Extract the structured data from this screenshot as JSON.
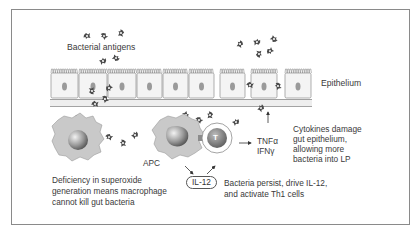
{
  "figure": {
    "labels": {
      "bacterial_antigens": "Bacterial antigens",
      "epithelium": "Epithelium",
      "apc": "APC",
      "t_cell": "T",
      "il12": "IL-12",
      "tnf": "TNFα",
      "ifn": "IFNγ"
    },
    "captions": {
      "cytokines": [
        "Cytokines damage",
        "gut epithelium,",
        "allowing more",
        "bacteria into LP"
      ],
      "macrophage": [
        "Deficiency in superoxide",
        "generation means macrophage",
        "cannot kill gut bacteria"
      ],
      "bacteria_persist": [
        "Bacteria persist, drive IL-12,",
        "and activate Th1 cells"
      ]
    },
    "colors": {
      "frame": "#8a8a8a",
      "cell_fill": "#f4f4f4",
      "cell_stroke": "#8c8c8c",
      "nucleus": "#9a9a9a",
      "membrane": "#e6e6e6",
      "macrophage": "#c9c9c9",
      "bacteria": "#4a4a4a",
      "t_cell": "#7a7a7a"
    }
  }
}
